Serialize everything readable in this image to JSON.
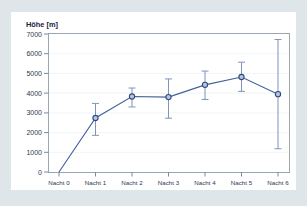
{
  "chart_data": {
    "type": "line",
    "title": "",
    "ylabel": "Höhe [m]",
    "xlabel": "",
    "categories": [
      "Nacht 0",
      "Nacht 1",
      "Nacht 2",
      "Nacht 3",
      "Nacht 4",
      "Nacht 5",
      "Nacht 6"
    ],
    "values": [
      0,
      2740,
      3830,
      3800,
      4420,
      4820,
      3950
    ],
    "error_low": [
      0,
      1860,
      3300,
      2730,
      3680,
      4090,
      1180
    ],
    "error_high": [
      0,
      3480,
      4260,
      4720,
      5120,
      5570,
      6720
    ],
    "ylim": [
      0,
      7000
    ],
    "yticks": [
      0,
      1000,
      2000,
      3000,
      4000,
      5000,
      6000,
      7000
    ],
    "ytick_labels": [
      "0",
      "1000",
      "2000",
      "3000",
      "4000",
      "5000",
      "6000",
      "7000"
    ],
    "grid": true,
    "legend": null,
    "series": [
      {
        "name": "Höhe",
        "values": [
          0,
          2740,
          3830,
          3800,
          4420,
          4820,
          3950
        ],
        "marker": "circle",
        "line_color": "#41619b",
        "marker_fill": "#b9c6de",
        "marker_edge": "#2e4a80",
        "errorbar_color": "#7f93bb"
      }
    ]
  },
  "colors": {
    "page_background": "#dfe6e9",
    "card_background": "#ffffff",
    "axis": "#7e8a99",
    "frame": "#9aa6b4",
    "grid": "#eef1f4",
    "text": "#2b3a52",
    "accent": "#41619b"
  }
}
